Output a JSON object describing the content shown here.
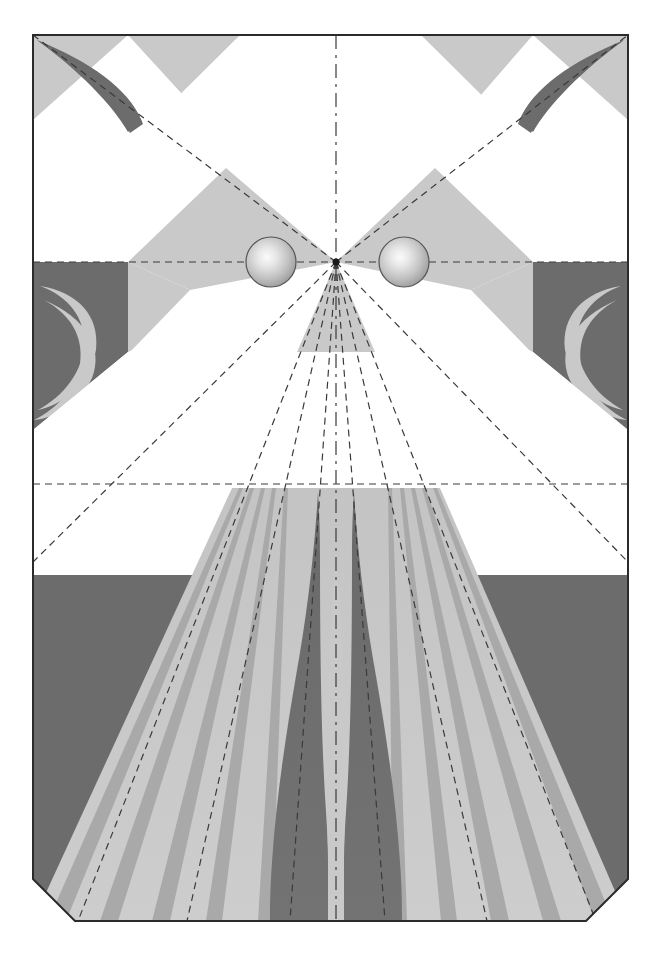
{
  "canvas": {
    "width": 661,
    "height": 958,
    "background": "#ffffff",
    "title": "Perspective construction illustration"
  },
  "palette": {
    "background": "#ffffff",
    "paper": "#ffffff",
    "light_gray": "#c9c9c9",
    "mid_gray": "#b8b8b8",
    "dark_gray": "#6c6c6c",
    "stripe_gray": "#a8a8a8",
    "outline": "#2b2b2b",
    "construction_line": "#3a3a3a",
    "sphere_highlight": "#f2f2f2",
    "sphere_mid": "#c2c2c2",
    "sphere_shadow": "#8f8f8f",
    "sphere_outline": "#555555"
  },
  "frame": {
    "label": "picture-plane-frame",
    "left": 33,
    "top": 35,
    "right": 628,
    "bottom": 921,
    "bevel": 42,
    "stroke_width": 2,
    "beveled_corners": [
      "bottom-left",
      "bottom-right"
    ],
    "sharp_corners": [
      "top-left",
      "top-right"
    ]
  },
  "vanishing_point": {
    "label": "vanishing-point",
    "x": 336,
    "y": 262,
    "marker_radius": 4
  },
  "horizon": {
    "label": "horizon-line",
    "y": 262,
    "style": "dashed"
  },
  "ground_line": {
    "label": "ground-line",
    "y": 484,
    "style": "dashed"
  },
  "construction_lines": {
    "style": "dashed",
    "dash_pattern": "7 5",
    "center_axis_dash": "14 6 3 6",
    "radial_rays_to_bottom": [
      {
        "name": "ray-far-left",
        "x_at_bottom": 78
      },
      {
        "name": "ray-left-outer",
        "x_at_bottom": 187
      },
      {
        "name": "ray-left-inner",
        "x_at_bottom": 290
      },
      {
        "name": "ray-center",
        "x_at_bottom": 336
      },
      {
        "name": "ray-right-inner",
        "x_at_bottom": 385
      },
      {
        "name": "ray-right-outer",
        "x_at_bottom": 487
      },
      {
        "name": "ray-far-right",
        "x_at_bottom": 596
      }
    ],
    "diagonals_to_corners": [
      {
        "name": "diagonal-top-left",
        "x": 33,
        "y": 35
      },
      {
        "name": "diagonal-top-right",
        "x": 628,
        "y": 35
      },
      {
        "name": "diagonal-bottom-left",
        "x": 33,
        "y": 562
      },
      {
        "name": "diagonal-bottom-right",
        "x": 628,
        "y": 562
      }
    ]
  },
  "spheres": [
    {
      "name": "sphere-left",
      "cx": 271,
      "cy": 262,
      "r": 25
    },
    {
      "name": "sphere-right",
      "cx": 404,
      "cy": 262,
      "r": 25
    }
  ],
  "shapes": {
    "upper_band": {
      "name": "upper-shaded-band",
      "description": "Light gray wedges radiating from the vanishing point toward the upper corners"
    },
    "corner_curls": {
      "name": "corner-curl-motifs",
      "count": 4,
      "description": "Dark gray crescent / curl forms tucked into each outer corner region"
    },
    "ground_fan": {
      "name": "ground-plane-fan",
      "stripe_count": 14,
      "description": "Fan of perspective stripes converging on the vanishing point across the lower plane"
    },
    "flames": {
      "name": "central-flame-pair",
      "count": 2,
      "description": "Two tall dark tapering flame shapes flanking the central axis on the ground plane"
    },
    "dark_base_band": {
      "name": "dark-base-band",
      "top_y": 575,
      "description": "Dark gray field occupying the lower portion outside the fan"
    }
  }
}
